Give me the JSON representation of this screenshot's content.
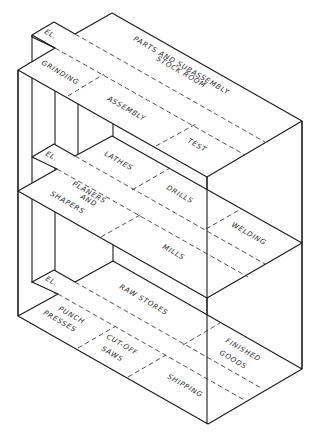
{
  "diagram": {
    "type": "isometric multi-floor plant layout",
    "floors": [
      {
        "name": "top-floor",
        "areas": [
          {
            "id": "el",
            "label": "EL."
          },
          {
            "id": "parts-stock",
            "label_lines": [
              "PARTS AND SUBASSEMBLY",
              "STOCK ROOM"
            ]
          },
          {
            "id": "grinding",
            "label": "GRINDING"
          },
          {
            "id": "assembly",
            "label": "ASSEMBLY"
          },
          {
            "id": "test",
            "label": "TEST"
          }
        ]
      },
      {
        "name": "middle-floor",
        "areas": [
          {
            "id": "el",
            "label": "EL."
          },
          {
            "id": "lathes",
            "label": "LATHES"
          },
          {
            "id": "planers",
            "label_lines": [
              "PLANERS",
              "AND",
              "SHAPERS"
            ]
          },
          {
            "id": "drills",
            "label": "DRILLS"
          },
          {
            "id": "welding",
            "label": "WELDING"
          },
          {
            "id": "mills",
            "label": "MILLS"
          }
        ]
      },
      {
        "name": "bottom-floor",
        "areas": [
          {
            "id": "el",
            "label": "EL."
          },
          {
            "id": "raw-stores",
            "label": "RAW STORES"
          },
          {
            "id": "punch",
            "label_lines": [
              "PUNCH",
              "PRESSES"
            ]
          },
          {
            "id": "cutoff",
            "label_lines": [
              "CUT-OFF",
              "SAWS"
            ]
          },
          {
            "id": "finished",
            "label_lines": [
              "FINISHED",
              "GOODS"
            ]
          },
          {
            "id": "shipping",
            "label": "SHIPPING"
          }
        ]
      }
    ]
  }
}
